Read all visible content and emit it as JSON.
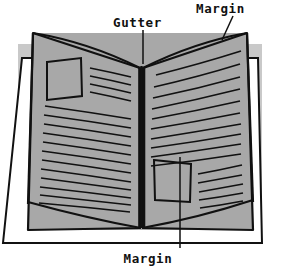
{
  "figure": {
    "type": "line-diagram",
    "background_color": "#ffffff",
    "page_fill_color": "#a8a8a8",
    "shadow_color": "#c9c9c9",
    "ink_color": "#111111"
  },
  "labels": {
    "gutter": "Gutter",
    "margin_top_right": "Margin",
    "margin_bottom": "Margin"
  },
  "parts": {
    "left_page": "left-page",
    "right_page": "right-page",
    "spine": "gutter-fold",
    "left_image_box": "left-page-image-box",
    "right_image_box": "right-page-image-box",
    "text_lines_left_count": 16,
    "text_lines_right_count": 15
  }
}
